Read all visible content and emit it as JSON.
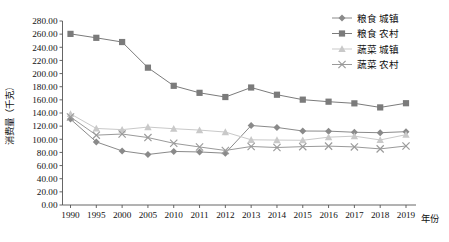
{
  "chart_data": {
    "type": "line",
    "title": "",
    "xlabel": "年份",
    "ylabel": "消费量（千克）",
    "categories": [
      "1990",
      "1995",
      "2000",
      "2005",
      "2010",
      "2011",
      "2012",
      "2013",
      "2014",
      "2015",
      "2016",
      "2017",
      "2018",
      "2019"
    ],
    "ylim": [
      0,
      280
    ],
    "ytick_step": 20,
    "ytick_labels": [
      "0.00",
      "20.00",
      "40.00",
      "60.00",
      "80.00",
      "100.00",
      "120.00",
      "140.00",
      "160.00",
      "180.00",
      "200.00",
      "220.00",
      "240.00",
      "260.00",
      "280.00"
    ],
    "grid": false,
    "legend_position": "top-right",
    "series": [
      {
        "name": "粮食 城镇",
        "marker": "diamond",
        "color": "#8a8a8a",
        "values": [
          130.7,
          96.0,
          82.3,
          76.9,
          81.5,
          80.7,
          78.8,
          121.0,
          118.0,
          112.6,
          112.4,
          110.7,
          110.0,
          111.6
        ]
      },
      {
        "name": "粮食 农村",
        "marker": "square",
        "color": "#7b7b7b",
        "values": [
          260.4,
          254.4,
          248.0,
          209.0,
          181.4,
          170.7,
          164.3,
          178.8,
          167.8,
          160.3,
          157.2,
          154.7,
          148.5,
          154.9
        ]
      },
      {
        "name": "蔬菜 城镇",
        "marker": "triangle",
        "color": "#c9c9c9",
        "values": [
          138.7,
          116.5,
          114.7,
          118.6,
          116.1,
          114.0,
          111.0,
          99.2,
          98.8,
          98.5,
          103.2,
          104.8,
          99.0,
          107.0
        ]
      },
      {
        "name": "蔬菜 农村",
        "marker": "x",
        "color": "#9a9a9a",
        "values": [
          134.0,
          106.3,
          108.0,
          102.6,
          93.9,
          88.3,
          83.0,
          89.0,
          87.5,
          88.8,
          89.6,
          88.4,
          85.4,
          89.8
        ]
      }
    ]
  },
  "legend": {
    "items": [
      {
        "label": "粮食 城镇"
      },
      {
        "label": "粮食 农村"
      },
      {
        "label": "蔬菜 城镇"
      },
      {
        "label": "蔬菜 农村"
      }
    ]
  },
  "axes": {
    "y_title": "消费量（千克）",
    "x_title": "年份"
  }
}
